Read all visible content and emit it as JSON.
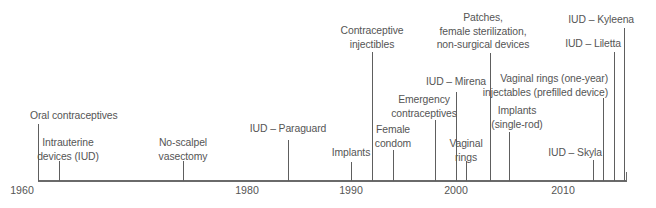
{
  "colors": {
    "line": "#5e5e5e",
    "text": "#555555",
    "background": "#ffffff"
  },
  "axis": {
    "start_year": 1960,
    "end_year": 2016,
    "tick_labels": [
      "1960",
      "1980",
      "1990",
      "2000",
      "2010"
    ]
  },
  "events": [
    {
      "id": "oral",
      "label_lines": [
        "Oral contraceptives"
      ],
      "year": "1960"
    },
    {
      "id": "iud",
      "label_lines": [
        "Intrauterine",
        "devices (IUD)"
      ],
      "year": "1962"
    },
    {
      "id": "vasectomy",
      "label_lines": [
        "No-scalpel",
        "vasectomy"
      ],
      "year": "1974"
    },
    {
      "id": "paraguard",
      "label_lines": [
        "IUD – Paraguard"
      ],
      "year": "1984"
    },
    {
      "id": "implants",
      "label_lines": [
        "Implants"
      ],
      "year": "1990"
    },
    {
      "id": "injectibles",
      "label_lines": [
        "Contraceptive",
        "injectibles"
      ],
      "year": "1992"
    },
    {
      "id": "condom",
      "label_lines": [
        "Female",
        "condom"
      ],
      "year": "1994"
    },
    {
      "id": "emergency",
      "label_lines": [
        "Emergency",
        "contraceptives"
      ],
      "year": "1998"
    },
    {
      "id": "mirena",
      "label_lines": [
        "IUD – Mirena"
      ],
      "year": "2000"
    },
    {
      "id": "vaginal_rings",
      "label_lines": [
        "Vaginal",
        "rings"
      ],
      "year": "2001"
    },
    {
      "id": "patches",
      "label_lines": [
        "Patches,",
        "female sterilization,",
        "non-surgical devices"
      ],
      "year": "2002"
    },
    {
      "id": "implants_single",
      "label_lines": [
        "Implants",
        "(single-rod)"
      ],
      "year": "2006"
    },
    {
      "id": "skyla",
      "label_lines": [
        "IUD – Skyla"
      ],
      "year": "2013"
    },
    {
      "id": "rings_one_year",
      "label_lines": [
        "Vaginal rings (one-year)",
        "injectables (prefilled device)"
      ],
      "year": "2014"
    },
    {
      "id": "liletta",
      "label_lines": [
        "IUD – Liletta"
      ],
      "year": "2015"
    },
    {
      "id": "kyleena",
      "label_lines": [
        "IUD – Kyleena"
      ],
      "year": "2016"
    }
  ]
}
